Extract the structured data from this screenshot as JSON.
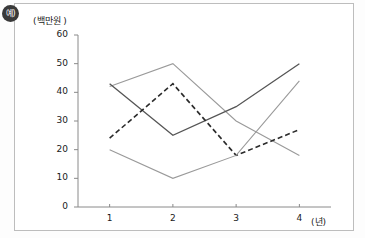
{
  "badge": {
    "label": "예)",
    "name": "corner-badge"
  },
  "chart_data": {
    "type": "line",
    "title": "",
    "xlabel": "(년)",
    "ylabel": "(백만원 )",
    "x": [
      1,
      2,
      3,
      4
    ],
    "xtick_labels": [
      "1",
      "2",
      "3",
      "4"
    ],
    "ytick_labels": [
      "0",
      "10",
      "20",
      "30",
      "40",
      "50",
      "60"
    ],
    "yticks": [
      0,
      10,
      20,
      30,
      40,
      50,
      60
    ],
    "ylim": [
      0,
      60
    ],
    "xlim": [
      0.5,
      4.5
    ],
    "grid": false,
    "legend": "none",
    "series": [
      {
        "name": "series-a",
        "style": "solid",
        "color": "#9a9a9a",
        "width": 1.1,
        "values": [
          42,
          50,
          30,
          18
        ]
      },
      {
        "name": "series-b",
        "style": "solid",
        "color": "#555555",
        "width": 1.3,
        "values": [
          43,
          25,
          35,
          50
        ]
      },
      {
        "name": "series-c",
        "style": "dashed",
        "color": "#2b2b2b",
        "width": 1.6,
        "values": [
          24,
          43,
          18,
          27
        ]
      },
      {
        "name": "series-d",
        "style": "solid",
        "color": "#9a9a9a",
        "width": 1.1,
        "values": [
          20,
          10,
          18,
          44
        ]
      }
    ]
  },
  "axes": {
    "axis_color": "#8a8a8a",
    "tick_color": "#8a8a8a"
  }
}
